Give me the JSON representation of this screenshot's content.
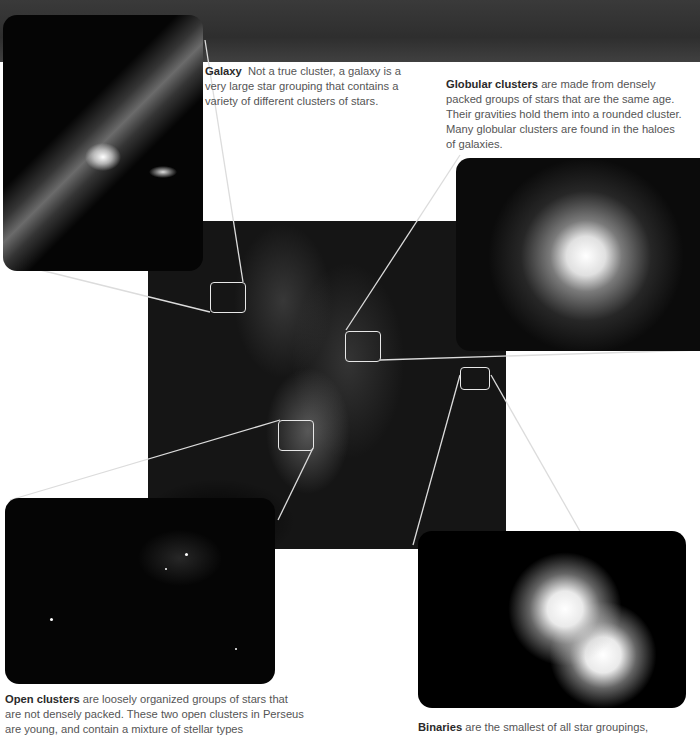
{
  "panels": {
    "galaxy": {
      "label": "Galaxy",
      "description": "Not a true cluster, a galaxy is a very large star grouping that contains a variety of different clusters of stars."
    },
    "globular": {
      "label": "Globular clusters",
      "description": "are made from densely packed groups of stars that are the same age. Their gravities hold them into a rounded cluster. Many globular clusters are found in the haloes of galaxies."
    },
    "open": {
      "label": "Open clusters",
      "description": "are loosely organized groups of stars that are not densely packed. These two open clusters in Perseus are young, and contain a mixture of stellar types"
    },
    "binaries": {
      "label": "Binaries",
      "description": "are the smallest of all star groupings,"
    }
  },
  "colors": {
    "leader_line": "#e0e0e0",
    "caption_text": "#555555",
    "caption_bold": "#2a2a2a"
  }
}
